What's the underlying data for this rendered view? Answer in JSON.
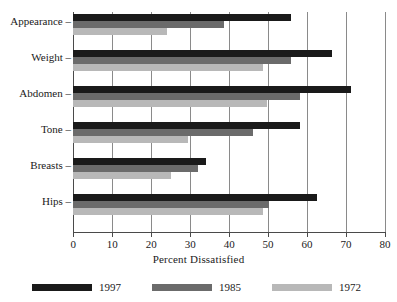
{
  "chart_data": {
    "type": "bar",
    "orientation": "horizontal",
    "title": "",
    "xlabel": "Percent Dissatisfied",
    "ylabel": "",
    "xlim": [
      0,
      80
    ],
    "xticks": [
      "0",
      "10",
      "20",
      "30",
      "40",
      "50",
      "60",
      "70",
      "80"
    ],
    "grid": "vertical gridlines at every x tick",
    "legend_position": "bottom",
    "categories": [
      "Appearance",
      "Weight",
      "Abdomen",
      "Tone",
      "Breasts",
      "Hips"
    ],
    "series": [
      {
        "name": "1997",
        "color": "#1a1a1a",
        "values": [
          56.0,
          66.5,
          71.3,
          58.2,
          34.0,
          62.5
        ]
      },
      {
        "name": "1985",
        "color": "#6b6b6b",
        "values": [
          38.7,
          56.0,
          58.3,
          46.2,
          32.0,
          50.2
        ]
      },
      {
        "name": "1972",
        "color": "#b8b8b8",
        "values": [
          24.0,
          48.8,
          49.8,
          29.5,
          25.2,
          48.8
        ]
      }
    ]
  },
  "axis": {
    "x_label": "Percent Dissatisfied",
    "x_ticks": [
      "0",
      "10",
      "20",
      "30",
      "40",
      "50",
      "60",
      "70",
      "80"
    ],
    "y_categories": [
      "Appearance",
      "Weight",
      "Abdomen",
      "Tone",
      "Breasts",
      "Hips"
    ],
    "y_label_dash": "–"
  },
  "legend": {
    "items": [
      {
        "label": "1997",
        "color": "#1a1a1a"
      },
      {
        "label": "1985",
        "color": "#6b6b6b"
      },
      {
        "label": "1972",
        "color": "#b8b8b8"
      }
    ]
  },
  "title": {
    "text": ""
  }
}
